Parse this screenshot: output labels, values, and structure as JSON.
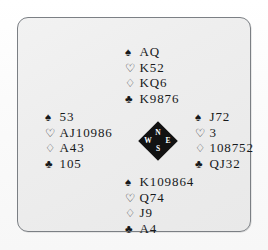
{
  "panel": {
    "border_color": "#7b7f84",
    "background_color": "#eeeeee"
  },
  "compass": {
    "north_label": "N",
    "west_label": "W",
    "east_label": "E",
    "south_label": "S",
    "fill_color": "#121212",
    "text_color": "#ffffff"
  },
  "suit_symbols": {
    "spade": "♠",
    "heart": "♡",
    "diamond": "♢",
    "club": "♣"
  },
  "hands": {
    "north": {
      "position_label": "North",
      "spades": "AQ",
      "hearts": "K52",
      "diamonds": "KQ6",
      "clubs": "K9876"
    },
    "west": {
      "position_label": "West",
      "spades": "53",
      "hearts": "AJ10986",
      "diamonds": "A43",
      "clubs": "105"
    },
    "east": {
      "position_label": "East",
      "spades": "J72",
      "hearts": "3",
      "diamonds": "108752",
      "clubs": "QJ32"
    },
    "south": {
      "position_label": "South",
      "spades": "K109864",
      "hearts": "Q74",
      "diamonds": "J9",
      "clubs": "A4"
    }
  }
}
